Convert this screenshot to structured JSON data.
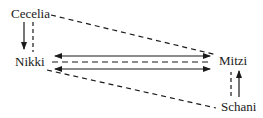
{
  "diagram": {
    "type": "relationship-diagram",
    "nodes": {
      "cecelia": "Cecelia",
      "nikki": "Nikki",
      "mitzi": "Mitzi",
      "schani": "Schani"
    },
    "edges": [
      {
        "from": "Cecelia",
        "to": "Nikki",
        "style": "solid",
        "arrow": "to"
      },
      {
        "from": "Cecelia",
        "to": "Nikki",
        "style": "dashed",
        "arrow": "none"
      },
      {
        "from": "Cecelia",
        "to": "Mitzi",
        "style": "dashed",
        "arrow": "none"
      },
      {
        "from": "Nikki",
        "to": "Mitzi",
        "style": "solid",
        "arrow": "both"
      },
      {
        "from": "Nikki",
        "to": "Mitzi",
        "style": "dashed",
        "arrow": "none"
      },
      {
        "from": "Nikki",
        "to": "Mitzi",
        "style": "solid",
        "arrow": "both"
      },
      {
        "from": "Nikki",
        "to": "Schani",
        "style": "dashed",
        "arrow": "none"
      },
      {
        "from": "Schani",
        "to": "Mitzi",
        "style": "dashed",
        "arrow": "none"
      },
      {
        "from": "Schani",
        "to": "Mitzi",
        "style": "solid",
        "arrow": "to"
      }
    ],
    "colors": {
      "line": "#1a1a1a",
      "background": "#ffffff"
    }
  }
}
